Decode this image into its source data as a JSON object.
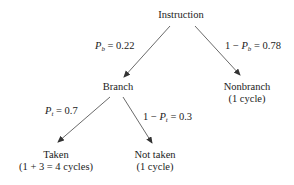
{
  "diagram": {
    "type": "probability-tree",
    "colors": {
      "line": "#444444",
      "text": "#222222",
      "background": "#ffffff"
    },
    "nodes": {
      "root": {
        "label": "Instruction"
      },
      "branch": {
        "label": "Branch"
      },
      "nonbranch": {
        "label": "Nonbranch",
        "detail": "(1 cycle)"
      },
      "taken": {
        "label": "Taken",
        "detail": "(1 + 3 = 4 cycles)"
      },
      "not_taken": {
        "label": "Not taken",
        "detail": "(1 cycle)"
      }
    },
    "edges": {
      "root_to_branch": {
        "var": "P",
        "sub": "b",
        "rest": " = 0.22",
        "prefix": ""
      },
      "root_to_nonbranch": {
        "prefix": "1 − ",
        "var": "P",
        "sub": "b",
        "rest": " = 0.78"
      },
      "branch_to_taken": {
        "var": "P",
        "sub": "t",
        "rest": " = 0.7",
        "prefix": ""
      },
      "branch_to_not_taken": {
        "prefix": "1 − ",
        "var": "P",
        "sub": "t",
        "rest": " = 0.3"
      }
    }
  }
}
